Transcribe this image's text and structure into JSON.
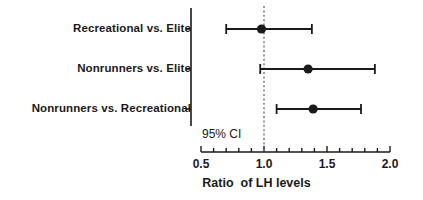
{
  "chart_data": {
    "type": "scatter",
    "subtype": "forest-plot",
    "title": "",
    "xlabel": "Ratio  of LH levels",
    "ylabel": "",
    "xlim": [
      0.5,
      2.0
    ],
    "xticks": [
      0.5,
      1.0,
      1.5,
      2.0
    ],
    "xtick_labels": [
      "0.5",
      "1.0",
      "1.5",
      "2.0"
    ],
    "minor_tick_step": 0.1,
    "grid": false,
    "legend": "none",
    "reference_line": {
      "value": 1.0,
      "style": "dotted",
      "color": "#555555"
    },
    "annotation": "95% CI",
    "categories": [
      "Recreational vs. Elite",
      "Nonrunners vs. Elite",
      "Nonrunners vs. Recreational"
    ],
    "series": [
      {
        "name": "Ratio of LH levels (95% CI)",
        "points": [
          {
            "label": "Recreational vs. Elite",
            "estimate": 0.98,
            "ci_low": 0.7,
            "ci_high": 1.38
          },
          {
            "label": "Nonrunners vs. Elite",
            "estimate": 1.35,
            "ci_low": 0.97,
            "ci_high": 1.88
          },
          {
            "label": "Nonrunners vs. Recreational",
            "estimate": 1.39,
            "ci_low": 1.1,
            "ci_high": 1.77
          }
        ]
      }
    ],
    "colors": {
      "marker": "#1a1a1a",
      "line": "#1a1a1a",
      "axis": "#1a1a1a",
      "reference": "#555555",
      "background": "#ffffff"
    }
  }
}
